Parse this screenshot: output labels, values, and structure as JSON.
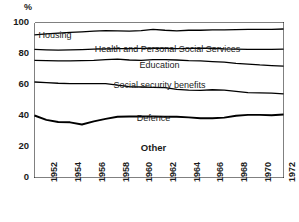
{
  "chart_data": {
    "type": "area",
    "title": "",
    "subtitle": "",
    "xlabel": "",
    "ylabel": "%",
    "ylim": [
      0,
      100
    ],
    "yticks": [
      0,
      20,
      40,
      60,
      80,
      100
    ],
    "ytick_labels": [
      "0",
      "20",
      "40",
      "60",
      "80",
      "100"
    ],
    "xlim": [
      1951,
      1972
    ],
    "x": [
      1951,
      1952,
      1953,
      1954,
      1955,
      1956,
      1957,
      1958,
      1959,
      1960,
      1961,
      1962,
      1963,
      1964,
      1965,
      1966,
      1967,
      1968,
      1969,
      1970,
      1971,
      1972
    ],
    "xtick_labels": [
      "1952",
      "1954",
      "1956",
      "1958",
      "1960",
      "1962",
      "1964",
      "1966",
      "1968",
      "1970",
      "1972"
    ],
    "xtick_years": [
      1952,
      1954,
      1956,
      1958,
      1960,
      1962,
      1964,
      1966,
      1968,
      1970,
      1972
    ],
    "xtick_all_years": [
      1951,
      1952,
      1953,
      1954,
      1955,
      1956,
      1957,
      1958,
      1959,
      1960,
      1961,
      1962,
      1963,
      1964,
      1965,
      1966,
      1967,
      1968,
      1969,
      1970,
      1971,
      1972
    ],
    "stacking": "cumulative-top-down",
    "grid": false,
    "legend": "inline-band-labels",
    "legend_position": "inside",
    "line_color": "#000000",
    "fill_color": "#ffffff",
    "series": [
      {
        "name": "Housing",
        "label_position": "top-left",
        "cumulative_top": [
          100,
          100,
          100,
          100,
          100,
          100,
          100,
          100,
          100,
          100,
          100,
          100,
          100,
          100,
          100,
          100,
          100,
          100,
          100,
          100,
          100,
          100
        ],
        "cumulative_bottom": [
          92.0,
          92.6,
          93.2,
          93.6,
          94.0,
          94.4,
          94.7,
          94.6,
          94.4,
          94.8,
          95.6,
          95.0,
          94.6,
          95.0,
          95.0,
          95.2,
          95.2,
          95.4,
          95.5,
          95.6,
          95.5,
          95.8
        ],
        "values": [
          8.0,
          7.4,
          6.8,
          6.4,
          6.0,
          5.6,
          5.3,
          5.4,
          5.6,
          5.2,
          4.4,
          5.0,
          5.4,
          5.0,
          5.0,
          4.8,
          4.8,
          4.6,
          4.5,
          4.4,
          4.5,
          4.2
        ]
      },
      {
        "name": "Health and Personal Social Services",
        "label_position": "center",
        "cumulative_top": [
          92.0,
          92.6,
          93.2,
          93.6,
          94.0,
          94.4,
          94.7,
          94.6,
          94.4,
          94.8,
          95.6,
          95.0,
          94.6,
          95.0,
          95.0,
          95.2,
          95.2,
          95.4,
          95.5,
          95.6,
          95.5,
          95.8
        ],
        "cumulative_bottom": [
          82.6,
          82.4,
          82.2,
          82.3,
          82.5,
          82.8,
          83.0,
          83.2,
          83.2,
          83.3,
          83.5,
          83.4,
          83.2,
          83.3,
          83.4,
          83.4,
          83.0,
          82.8,
          82.7,
          82.6,
          82.6,
          82.8
        ],
        "values": [
          9.4,
          10.2,
          11.0,
          11.3,
          11.5,
          11.6,
          11.7,
          11.4,
          11.2,
          11.5,
          12.1,
          11.6,
          11.4,
          11.7,
          11.6,
          11.8,
          12.2,
          12.6,
          12.8,
          13.0,
          12.9,
          13.0
        ]
      },
      {
        "name": "Education",
        "label_position": "center",
        "cumulative_top": [
          82.6,
          82.4,
          82.2,
          82.3,
          82.5,
          82.8,
          83.0,
          83.2,
          83.2,
          83.3,
          83.5,
          83.4,
          83.2,
          83.3,
          83.4,
          83.4,
          83.0,
          82.8,
          82.7,
          82.6,
          82.6,
          82.8
        ],
        "cumulative_bottom": [
          75.6,
          75.4,
          75.2,
          75.2,
          75.4,
          75.6,
          76.0,
          76.4,
          75.8,
          75.6,
          76.0,
          76.0,
          75.8,
          75.4,
          75.2,
          74.8,
          74.4,
          73.6,
          73.2,
          72.6,
          72.2,
          71.8
        ],
        "values": [
          7.0,
          7.0,
          7.0,
          7.1,
          7.1,
          7.2,
          7.0,
          6.8,
          7.4,
          7.7,
          7.5,
          7.4,
          7.4,
          7.9,
          8.2,
          8.6,
          8.6,
          9.2,
          9.5,
          10.0,
          10.4,
          11.0
        ]
      },
      {
        "name": "Social security benefits",
        "label_position": "center",
        "cumulative_top": [
          75.6,
          75.4,
          75.2,
          75.2,
          75.4,
          75.6,
          76.0,
          76.4,
          75.8,
          75.6,
          76.0,
          76.0,
          75.8,
          75.4,
          75.2,
          74.8,
          74.4,
          73.6,
          73.2,
          72.6,
          72.2,
          71.8
        ],
        "cumulative_bottom": [
          61.6,
          61.2,
          60.8,
          60.6,
          60.6,
          60.6,
          60.6,
          59.6,
          58.6,
          58.4,
          58.2,
          58.0,
          56.8,
          56.4,
          56.2,
          56.6,
          56.4,
          55.6,
          54.8,
          54.6,
          54.4,
          54.0
        ],
        "values": [
          14.0,
          14.2,
          14.4,
          14.6,
          14.8,
          15.0,
          15.4,
          16.8,
          17.2,
          17.2,
          17.8,
          18.0,
          19.0,
          19.0,
          19.0,
          18.2,
          18.0,
          18.0,
          18.4,
          18.0,
          17.8,
          17.8
        ]
      },
      {
        "name": "Defence",
        "label_position": "center",
        "cumulative_top": [
          61.6,
          61.2,
          60.8,
          60.6,
          60.6,
          60.6,
          60.6,
          59.6,
          58.6,
          58.4,
          58.2,
          58.0,
          56.8,
          56.4,
          56.2,
          56.6,
          56.4,
          55.6,
          54.8,
          54.6,
          54.4,
          54.0
        ],
        "cumulative_bottom": [
          40.0,
          37.2,
          35.8,
          35.6,
          34.2,
          36.2,
          37.8,
          39.2,
          39.4,
          39.4,
          39.4,
          39.2,
          39.2,
          38.8,
          38.2,
          38.2,
          38.6,
          39.8,
          40.4,
          40.4,
          40.2,
          40.6
        ],
        "values": [
          21.6,
          24.0,
          25.0,
          25.0,
          26.4,
          24.4,
          22.8,
          20.4,
          19.2,
          19.0,
          18.8,
          18.8,
          17.6,
          17.6,
          18.0,
          18.4,
          17.8,
          15.8,
          14.4,
          14.2,
          14.2,
          13.4
        ]
      },
      {
        "name": "Other",
        "label_position": "center",
        "bold": true,
        "cumulative_top": [
          40.0,
          37.2,
          35.8,
          35.6,
          34.2,
          36.2,
          37.8,
          39.2,
          39.4,
          39.4,
          39.4,
          39.2,
          39.2,
          38.8,
          38.2,
          38.2,
          38.6,
          39.8,
          40.4,
          40.4,
          40.2,
          40.6
        ],
        "cumulative_bottom": [
          0,
          0,
          0,
          0,
          0,
          0,
          0,
          0,
          0,
          0,
          0,
          0,
          0,
          0,
          0,
          0,
          0,
          0,
          0,
          0,
          0,
          0
        ],
        "values": [
          40.0,
          37.2,
          35.8,
          35.6,
          34.2,
          36.2,
          37.8,
          39.2,
          39.4,
          39.4,
          39.4,
          39.2,
          39.2,
          38.8,
          38.2,
          38.2,
          38.6,
          39.8,
          40.4,
          40.4,
          40.2,
          40.6
        ]
      }
    ]
  }
}
